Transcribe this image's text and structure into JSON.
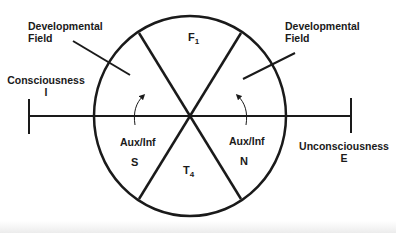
{
  "title_partial": "...p... ...g...",
  "labels": {
    "dev_field_left": [
      "Developmental",
      "Field"
    ],
    "dev_field_right": [
      "Developmental",
      "Field"
    ],
    "consciousness": "Consciousness",
    "consciousness_code": "I",
    "unconsciousness": "Unconsciousness",
    "unconsciousness_code": "E",
    "aux_left": "Aux/Inf",
    "aux_right": "Aux/Inf",
    "sector_left": "S",
    "sector_right": "N",
    "top_letter": "F",
    "top_sub": "1",
    "bottom_letter": "T",
    "bottom_sub": "4"
  },
  "colors": {
    "stroke": "#1a1a1a",
    "background": "#ffffff"
  }
}
